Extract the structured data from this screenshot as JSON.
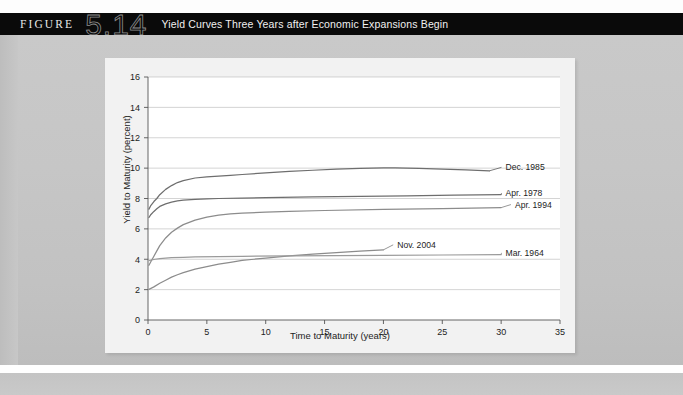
{
  "header": {
    "figure_word": "FIGURE",
    "figure_number": "5.14",
    "title": "Yield Curves Three Years after Economic Expansions Begin"
  },
  "chart_data": {
    "type": "line",
    "title": "Yield Curves Three Years after Economic Expansions Begin",
    "xlabel": "Time to Maturity (years)",
    "ylabel": "Yield to Maturity (percent)",
    "xlim": [
      0,
      35
    ],
    "ylim": [
      0,
      16
    ],
    "xticks": [
      0,
      5,
      10,
      15,
      20,
      25,
      30,
      35
    ],
    "yticks": [
      0,
      2,
      4,
      6,
      8,
      10,
      12,
      14,
      16
    ],
    "grid": "horizontal",
    "legend": "inline-right-labels",
    "series": [
      {
        "name": "Dec. 1985",
        "color": "#6e6e6e",
        "label_x": 30.2,
        "label_y": 10.05,
        "points": [
          [
            0.08,
            7.3
          ],
          [
            0.25,
            7.55
          ],
          [
            0.5,
            7.8
          ],
          [
            0.75,
            8.0
          ],
          [
            1.0,
            8.25
          ],
          [
            1.5,
            8.6
          ],
          [
            2.0,
            8.85
          ],
          [
            2.5,
            9.05
          ],
          [
            3.0,
            9.18
          ],
          [
            4.0,
            9.35
          ],
          [
            5.0,
            9.43
          ],
          [
            6.0,
            9.48
          ],
          [
            7.0,
            9.53
          ],
          [
            8.0,
            9.58
          ],
          [
            10.0,
            9.68
          ],
          [
            12.0,
            9.78
          ],
          [
            14.0,
            9.86
          ],
          [
            16.0,
            9.93
          ],
          [
            18.0,
            9.98
          ],
          [
            20.0,
            10.02
          ],
          [
            21.0,
            10.02
          ],
          [
            23.0,
            9.99
          ],
          [
            25.0,
            9.94
          ],
          [
            27.0,
            9.88
          ],
          [
            29.0,
            9.82
          ]
        ]
      },
      {
        "name": "Apr. 1978",
        "color": "#6e6e6e",
        "label_x": 30.2,
        "label_y": 8.35,
        "points": [
          [
            0.08,
            6.75
          ],
          [
            0.25,
            6.95
          ],
          [
            0.5,
            7.15
          ],
          [
            0.75,
            7.32
          ],
          [
            1.0,
            7.48
          ],
          [
            1.5,
            7.65
          ],
          [
            2.0,
            7.76
          ],
          [
            2.5,
            7.84
          ],
          [
            3.0,
            7.89
          ],
          [
            4.0,
            7.95
          ],
          [
            5.0,
            7.98
          ],
          [
            6.0,
            8.0
          ],
          [
            8.0,
            8.03
          ],
          [
            10.0,
            8.06
          ],
          [
            14.0,
            8.1
          ],
          [
            18.0,
            8.14
          ],
          [
            22.0,
            8.18
          ],
          [
            26.0,
            8.22
          ],
          [
            30.0,
            8.26
          ]
        ]
      },
      {
        "name": "Apr. 1994",
        "color": "#8c8c8c",
        "label_x": 31.0,
        "label_y": 7.6,
        "points": [
          [
            0.08,
            3.6
          ],
          [
            0.25,
            3.85
          ],
          [
            0.5,
            4.2
          ],
          [
            0.75,
            4.55
          ],
          [
            1.0,
            4.9
          ],
          [
            1.5,
            5.4
          ],
          [
            2.0,
            5.78
          ],
          [
            2.5,
            6.05
          ],
          [
            3.0,
            6.28
          ],
          [
            4.0,
            6.58
          ],
          [
            5.0,
            6.78
          ],
          [
            6.0,
            6.9
          ],
          [
            7.0,
            6.98
          ],
          [
            8.0,
            7.03
          ],
          [
            10.0,
            7.1
          ],
          [
            12.0,
            7.15
          ],
          [
            15.0,
            7.21
          ],
          [
            20.0,
            7.28
          ],
          [
            25.0,
            7.34
          ],
          [
            30.0,
            7.4
          ]
        ]
      },
      {
        "name": "Nov. 2004",
        "color": "#8c8c8c",
        "label_x": 21.0,
        "label_y": 4.95,
        "points": [
          [
            0.08,
            2.02
          ],
          [
            0.5,
            2.18
          ],
          [
            1.0,
            2.42
          ],
          [
            1.5,
            2.62
          ],
          [
            2.0,
            2.82
          ],
          [
            2.5,
            2.98
          ],
          [
            3.0,
            3.12
          ],
          [
            4.0,
            3.35
          ],
          [
            5.0,
            3.52
          ],
          [
            6.0,
            3.68
          ],
          [
            7.0,
            3.8
          ],
          [
            8.0,
            3.92
          ],
          [
            9.0,
            4.0
          ],
          [
            10.0,
            4.08
          ],
          [
            12.0,
            4.22
          ],
          [
            14.0,
            4.33
          ],
          [
            16.0,
            4.44
          ],
          [
            18.0,
            4.53
          ],
          [
            20.0,
            4.62
          ]
        ]
      },
      {
        "name": "Mar. 1964",
        "color": "#9a9a9a",
        "label_x": 30.2,
        "label_y": 4.42,
        "points": [
          [
            0.08,
            3.9
          ],
          [
            0.3,
            3.95
          ],
          [
            0.6,
            4.0
          ],
          [
            1.0,
            4.04
          ],
          [
            2.0,
            4.1
          ],
          [
            3.0,
            4.13
          ],
          [
            4.0,
            4.15
          ],
          [
            6.0,
            4.17
          ],
          [
            8.0,
            4.19
          ],
          [
            12.0,
            4.22
          ],
          [
            16.0,
            4.24
          ],
          [
            20.0,
            4.26
          ],
          [
            25.0,
            4.28
          ],
          [
            30.0,
            4.3
          ]
        ]
      }
    ]
  }
}
